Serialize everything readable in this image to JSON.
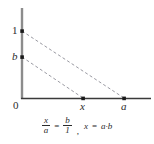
{
  "figure": {
    "colors": {
      "y_axis": "#8c8c8c",
      "x_axis": "#3a3a3a",
      "dashed_line": "#9a9aa2",
      "point": "#1a1a1a",
      "text": "#2b2b2b",
      "background": "#ffffff"
    },
    "axes": {
      "y_label_top": "1",
      "y_label_mid": "b",
      "x_label_origin": "0",
      "x_label_mid": "x",
      "x_label_right": "a"
    },
    "points": [
      {
        "name": "one-on-y-axis",
        "label": "1",
        "px": 22,
        "py": 31
      },
      {
        "name": "b-on-y-axis",
        "label": "b",
        "px": 22,
        "py": 57
      },
      {
        "name": "x-on-x-axis",
        "label": "x",
        "px": 83,
        "py": 98
      },
      {
        "name": "a-on-x-axis",
        "label": "a",
        "px": 124,
        "py": 98
      }
    ],
    "dashed_lines": [
      {
        "name": "line-1-to-a",
        "from": "1",
        "to": "a",
        "x1": 22,
        "y1": 31,
        "x2": 124,
        "y2": 98
      },
      {
        "name": "line-b-to-x",
        "from": "b",
        "to": "x",
        "x1": 22,
        "y1": 57,
        "x2": 83,
        "y2": 98
      }
    ],
    "equation": {
      "fraction_left_numerator": "x",
      "fraction_left_denominator": "a",
      "equals": "=",
      "fraction_right_numerator": "b",
      "fraction_right_denominator": "1",
      "separator": ",",
      "result_lhs": "x",
      "result_equals": "=",
      "result_rhs": "a·b"
    }
  }
}
